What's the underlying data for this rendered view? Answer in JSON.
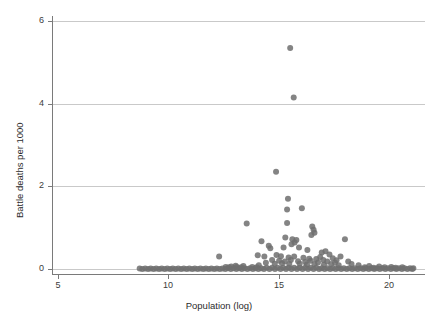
{
  "chart_data": {
    "type": "scatter",
    "title": "",
    "xlabel": "Population (log)",
    "ylabel": "Battle deaths per 1000",
    "xlim": [
      4.6,
      21.6
    ],
    "ylim": [
      -0.16,
      6.25
    ],
    "xticks": [
      5,
      10,
      15,
      20
    ],
    "xticklabels": [
      "5",
      "10",
      "15",
      "20"
    ],
    "yticks": [
      0,
      2,
      4,
      6
    ],
    "yticklabels": [
      "0",
      "2",
      "4",
      "6"
    ],
    "grid": "horizontal",
    "legend": null,
    "marker": {
      "shape": "circle",
      "color": "#6e6e6e",
      "size": 6,
      "opacity": 0.85
    },
    "points": [
      [
        15.52,
        5.35
      ],
      [
        15.68,
        4.15
      ],
      [
        14.88,
        2.35
      ],
      [
        15.42,
        1.7
      ],
      [
        15.38,
        1.44
      ],
      [
        16.05,
        1.47
      ],
      [
        13.55,
        1.1
      ],
      [
        15.38,
        1.11
      ],
      [
        16.52,
        1.03
      ],
      [
        16.58,
        0.95
      ],
      [
        16.62,
        0.88
      ],
      [
        16.48,
        0.82
      ],
      [
        15.3,
        0.76
      ],
      [
        14.22,
        0.67
      ],
      [
        15.62,
        0.72
      ],
      [
        15.8,
        0.7
      ],
      [
        15.72,
        0.64
      ],
      [
        18.0,
        0.72
      ],
      [
        15.58,
        0.6
      ],
      [
        14.55,
        0.56
      ],
      [
        14.62,
        0.5
      ],
      [
        15.22,
        0.52
      ],
      [
        15.92,
        0.52
      ],
      [
        16.3,
        0.46
      ],
      [
        16.95,
        0.4
      ],
      [
        17.12,
        0.43
      ],
      [
        17.3,
        0.35
      ],
      [
        12.3,
        0.3
      ],
      [
        14.05,
        0.33
      ],
      [
        14.35,
        0.3
      ],
      [
        14.9,
        0.34
      ],
      [
        15.1,
        0.31
      ],
      [
        15.45,
        0.28
      ],
      [
        15.7,
        0.3
      ],
      [
        16.12,
        0.27
      ],
      [
        16.38,
        0.25
      ],
      [
        16.7,
        0.24
      ],
      [
        16.88,
        0.29
      ],
      [
        17.02,
        0.22
      ],
      [
        17.45,
        0.26
      ],
      [
        17.62,
        0.21
      ],
      [
        17.8,
        0.3
      ],
      [
        18.15,
        0.18
      ],
      [
        14.7,
        0.22
      ],
      [
        15.02,
        0.2
      ],
      [
        15.28,
        0.18
      ],
      [
        15.55,
        0.22
      ],
      [
        15.88,
        0.19
      ],
      [
        16.2,
        0.17
      ],
      [
        16.45,
        0.2
      ],
      [
        16.78,
        0.16
      ],
      [
        17.2,
        0.18
      ],
      [
        17.55,
        0.15
      ],
      [
        14.42,
        0.15
      ],
      [
        14.82,
        0.13
      ],
      [
        15.15,
        0.14
      ],
      [
        15.48,
        0.12
      ],
      [
        15.95,
        0.13
      ],
      [
        16.28,
        0.11
      ],
      [
        16.62,
        0.12
      ],
      [
        17.05,
        0.1
      ],
      [
        17.38,
        0.12
      ],
      [
        17.72,
        0.09
      ],
      [
        18.3,
        0.12
      ],
      [
        18.62,
        0.09
      ],
      [
        13.05,
        0.08
      ],
      [
        13.4,
        0.07
      ],
      [
        12.85,
        0.06
      ],
      [
        14.1,
        0.09
      ],
      [
        19.1,
        0.07
      ],
      [
        19.55,
        0.06
      ],
      [
        20.1,
        0.05
      ],
      [
        8.7,
        0.01
      ],
      [
        8.95,
        0.01
      ],
      [
        9.2,
        0.01
      ],
      [
        9.45,
        0.01
      ],
      [
        9.7,
        0.01
      ],
      [
        9.95,
        0.01
      ],
      [
        10.2,
        0.01
      ],
      [
        10.45,
        0.01
      ],
      [
        10.7,
        0.01
      ],
      [
        10.95,
        0.01
      ],
      [
        11.2,
        0.01
      ],
      [
        11.45,
        0.01
      ],
      [
        11.7,
        0.01
      ],
      [
        11.95,
        0.01
      ],
      [
        12.2,
        0.01
      ],
      [
        12.45,
        0.01
      ],
      [
        12.7,
        0.02
      ],
      [
        12.95,
        0.02
      ],
      [
        13.2,
        0.02
      ],
      [
        13.45,
        0.02
      ],
      [
        13.7,
        0.02
      ],
      [
        13.95,
        0.02
      ],
      [
        14.2,
        0.02
      ],
      [
        14.45,
        0.03
      ],
      [
        14.7,
        0.03
      ],
      [
        14.95,
        0.03
      ],
      [
        15.2,
        0.03
      ],
      [
        15.45,
        0.03
      ],
      [
        15.7,
        0.03
      ],
      [
        15.95,
        0.03
      ],
      [
        16.2,
        0.03
      ],
      [
        16.45,
        0.03
      ],
      [
        16.7,
        0.03
      ],
      [
        16.95,
        0.02
      ],
      [
        17.2,
        0.02
      ],
      [
        17.45,
        0.02
      ],
      [
        17.7,
        0.02
      ],
      [
        17.95,
        0.02
      ],
      [
        18.2,
        0.02
      ],
      [
        18.45,
        0.02
      ],
      [
        18.7,
        0.02
      ],
      [
        18.95,
        0.02
      ],
      [
        19.2,
        0.02
      ],
      [
        19.45,
        0.02
      ],
      [
        19.7,
        0.02
      ],
      [
        19.95,
        0.02
      ],
      [
        20.2,
        0.02
      ],
      [
        20.45,
        0.02
      ],
      [
        20.7,
        0.02
      ],
      [
        20.95,
        0.02
      ],
      [
        21.1,
        0.02
      ],
      [
        8.82,
        0.0
      ],
      [
        9.08,
        0.0
      ],
      [
        9.33,
        0.0
      ],
      [
        9.58,
        0.0
      ],
      [
        9.83,
        0.0
      ],
      [
        10.08,
        0.0
      ],
      [
        10.33,
        0.0
      ],
      [
        10.58,
        0.0
      ],
      [
        10.83,
        0.0
      ],
      [
        11.08,
        0.0
      ],
      [
        11.33,
        0.0
      ],
      [
        11.58,
        0.0
      ],
      [
        11.83,
        0.0
      ],
      [
        12.08,
        0.0
      ],
      [
        12.33,
        0.0
      ],
      [
        12.58,
        0.0
      ],
      [
        12.83,
        0.0
      ],
      [
        13.08,
        0.0
      ],
      [
        13.33,
        0.0
      ],
      [
        13.58,
        0.0
      ],
      [
        13.83,
        0.0
      ],
      [
        14.08,
        0.0
      ],
      [
        14.33,
        0.0
      ],
      [
        14.58,
        0.0
      ],
      [
        14.83,
        0.0
      ],
      [
        15.08,
        0.0
      ],
      [
        15.33,
        0.0
      ],
      [
        15.58,
        0.0
      ],
      [
        15.83,
        0.0
      ],
      [
        16.08,
        0.0
      ],
      [
        16.33,
        0.0
      ],
      [
        16.58,
        0.0
      ],
      [
        16.83,
        0.0
      ],
      [
        17.08,
        0.0
      ],
      [
        17.33,
        0.0
      ],
      [
        17.58,
        0.0
      ],
      [
        17.83,
        0.0
      ],
      [
        18.08,
        0.0
      ],
      [
        18.33,
        0.0
      ],
      [
        18.58,
        0.0
      ],
      [
        18.83,
        0.0
      ],
      [
        19.08,
        0.0
      ],
      [
        19.33,
        0.0
      ],
      [
        19.58,
        0.0
      ],
      [
        19.83,
        0.0
      ],
      [
        20.08,
        0.0
      ],
      [
        20.33,
        0.0
      ],
      [
        20.58,
        0.0
      ],
      [
        20.83,
        0.0
      ],
      [
        21.05,
        0.0
      ],
      [
        12.6,
        0.05
      ],
      [
        12.75,
        0.04
      ],
      [
        13.1,
        0.05
      ],
      [
        13.3,
        0.04
      ],
      [
        13.8,
        0.05
      ],
      [
        14.0,
        0.04
      ],
      [
        18.9,
        0.04
      ],
      [
        19.3,
        0.03
      ],
      [
        19.8,
        0.04
      ],
      [
        20.3,
        0.03
      ],
      [
        20.6,
        0.04
      ]
    ]
  },
  "colors": {
    "marker": "#6e6e6e",
    "grid": "#c9c9c9",
    "axis": "#7a7a7a",
    "text": "#2b2b2b",
    "background": "#ffffff"
  }
}
